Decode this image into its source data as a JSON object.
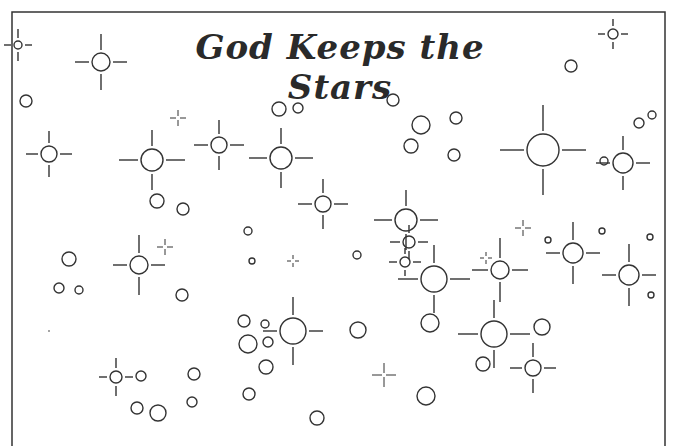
{
  "page": {
    "title": "God Keeps the Stars",
    "colors": {
      "ink": "#333333",
      "background": "#ffffff"
    }
  },
  "border": {
    "left": 12,
    "top": 12,
    "right": 665
  },
  "stars": [
    {
      "type": "star",
      "x": 18,
      "y": 45,
      "r": 4,
      "ray": [
        7,
        9
      ]
    },
    {
      "type": "star",
      "x": 101,
      "y": 62,
      "r": 9,
      "ray": [
        14,
        16
      ]
    },
    {
      "type": "star",
      "x": 49,
      "y": 154,
      "r": 8,
      "ray": [
        12,
        12
      ]
    },
    {
      "type": "star",
      "x": 152,
      "y": 160,
      "r": 11,
      "ray": [
        19,
        16
      ]
    },
    {
      "type": "star",
      "x": 219,
      "y": 145,
      "r": 8,
      "ray": [
        14,
        14
      ]
    },
    {
      "type": "star",
      "x": 281,
      "y": 158,
      "r": 11,
      "ray": [
        18,
        16
      ]
    },
    {
      "type": "star",
      "x": 323,
      "y": 204,
      "r": 8,
      "ray": [
        14,
        14
      ]
    },
    {
      "type": "star",
      "x": 543,
      "y": 150,
      "r": 16,
      "ray": [
        24,
        26
      ]
    },
    {
      "type": "star",
      "x": 623,
      "y": 163,
      "r": 10,
      "ray": [
        14,
        14
      ]
    },
    {
      "type": "star",
      "x": 613,
      "y": 34,
      "r": 5,
      "ray": [
        7,
        7
      ]
    },
    {
      "type": "star",
      "x": 406,
      "y": 220,
      "r": 11,
      "ray": [
        18,
        16
      ]
    },
    {
      "type": "star",
      "x": 409,
      "y": 242,
      "r": 6,
      "ray": [
        10,
        8
      ]
    },
    {
      "type": "star",
      "x": 405,
      "y": 262,
      "r": 5,
      "ray": [
        8,
        6
      ]
    },
    {
      "type": "star",
      "x": 434,
      "y": 279,
      "r": 13,
      "ray": [
        20,
        18
      ]
    },
    {
      "type": "star",
      "x": 500,
      "y": 270,
      "r": 9,
      "ray": [
        16,
        20
      ]
    },
    {
      "type": "star",
      "x": 573,
      "y": 253,
      "r": 10,
      "ray": [
        14,
        18
      ]
    },
    {
      "type": "star",
      "x": 629,
      "y": 275,
      "r": 10,
      "ray": [
        14,
        18
      ]
    },
    {
      "type": "star",
      "x": 139,
      "y": 265,
      "r": 9,
      "ray": [
        14,
        18
      ]
    },
    {
      "type": "star",
      "x": 293,
      "y": 331,
      "r": 13,
      "ray": [
        14,
        18
      ]
    },
    {
      "type": "star",
      "x": 494,
      "y": 334,
      "r": 13,
      "ray": [
        20,
        18
      ]
    },
    {
      "type": "star",
      "x": 533,
      "y": 368,
      "r": 8,
      "ray": [
        12,
        14
      ]
    },
    {
      "type": "star",
      "x": 116,
      "y": 377,
      "r": 6,
      "ray": [
        8,
        10
      ]
    }
  ],
  "sparkles": [
    {
      "x": 178,
      "y": 118,
      "s": 8
    },
    {
      "x": 165,
      "y": 247,
      "s": 8
    },
    {
      "x": 293,
      "y": 261,
      "s": 6
    },
    {
      "x": 523,
      "y": 228,
      "s": 8
    },
    {
      "x": 486,
      "y": 258,
      "s": 6
    },
    {
      "x": 384,
      "y": 375,
      "s": 12
    }
  ],
  "circles": [
    {
      "x": 26,
      "y": 101,
      "r": 6
    },
    {
      "x": 279,
      "y": 109,
      "r": 7
    },
    {
      "x": 298,
      "y": 108,
      "r": 5
    },
    {
      "x": 157,
      "y": 201,
      "r": 7
    },
    {
      "x": 183,
      "y": 209,
      "r": 6
    },
    {
      "x": 393,
      "y": 100,
      "r": 6
    },
    {
      "x": 421,
      "y": 125,
      "r": 9
    },
    {
      "x": 411,
      "y": 146,
      "r": 7
    },
    {
      "x": 456,
      "y": 118,
      "r": 6
    },
    {
      "x": 454,
      "y": 155,
      "r": 6
    },
    {
      "x": 571,
      "y": 66,
      "r": 6
    },
    {
      "x": 639,
      "y": 123,
      "r": 5
    },
    {
      "x": 652,
      "y": 115,
      "r": 4
    },
    {
      "x": 604,
      "y": 161,
      "r": 4
    },
    {
      "x": 248,
      "y": 231,
      "r": 4
    },
    {
      "x": 252,
      "y": 261,
      "r": 3
    },
    {
      "x": 357,
      "y": 255,
      "r": 4
    },
    {
      "x": 548,
      "y": 240,
      "r": 3
    },
    {
      "x": 602,
      "y": 231,
      "r": 3
    },
    {
      "x": 650,
      "y": 237,
      "r": 3
    },
    {
      "x": 651,
      "y": 295,
      "r": 3
    },
    {
      "x": 69,
      "y": 259,
      "r": 7
    },
    {
      "x": 59,
      "y": 288,
      "r": 5
    },
    {
      "x": 79,
      "y": 290,
      "r": 4
    },
    {
      "x": 182,
      "y": 295,
      "r": 6
    },
    {
      "x": 244,
      "y": 321,
      "r": 6
    },
    {
      "x": 265,
      "y": 324,
      "r": 4
    },
    {
      "x": 248,
      "y": 344,
      "r": 9
    },
    {
      "x": 268,
      "y": 342,
      "r": 5
    },
    {
      "x": 266,
      "y": 367,
      "r": 7
    },
    {
      "x": 358,
      "y": 330,
      "r": 8
    },
    {
      "x": 430,
      "y": 323,
      "r": 9
    },
    {
      "x": 542,
      "y": 327,
      "r": 8
    },
    {
      "x": 483,
      "y": 364,
      "r": 7
    },
    {
      "x": 141,
      "y": 376,
      "r": 5
    },
    {
      "x": 194,
      "y": 374,
      "r": 6
    },
    {
      "x": 137,
      "y": 408,
      "r": 6
    },
    {
      "x": 158,
      "y": 413,
      "r": 8
    },
    {
      "x": 192,
      "y": 402,
      "r": 5
    },
    {
      "x": 249,
      "y": 394,
      "r": 6
    },
    {
      "x": 317,
      "y": 418,
      "r": 7
    },
    {
      "x": 426,
      "y": 396,
      "r": 9
    }
  ],
  "dots": [
    {
      "x": 49,
      "y": 331
    }
  ]
}
